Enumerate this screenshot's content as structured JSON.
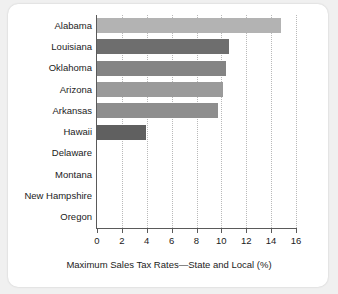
{
  "chart_data": {
    "type": "bar",
    "orientation": "horizontal",
    "title": "",
    "xlabel": "Maximum Sales Tax Rates—State and Local (%)",
    "ylabel": "",
    "xlim": [
      0,
      16
    ],
    "xticks": [
      0,
      2,
      4,
      6,
      8,
      10,
      12,
      14,
      16
    ],
    "grid": "vertical-dotted",
    "legend": "none",
    "categories": [
      "Alabama",
      "Louisiana",
      "Oklahoma",
      "Arizona",
      "Arkansas",
      "Hawaii",
      "Delaware",
      "Montana",
      "New Hampshire",
      "Oregon"
    ],
    "values": [
      14.8,
      10.6,
      10.4,
      10.1,
      9.7,
      3.9,
      0,
      0,
      0,
      0
    ],
    "bar_colors": [
      "#b3b3b3",
      "#6e6e6e",
      "#848484",
      "#9a9a9a",
      "#8e8e8e",
      "#606060",
      "#8a8a8a",
      "#8a8a8a",
      "#8a8a8a",
      "#8a8a8a"
    ]
  },
  "axis": {
    "line_color": "#5a5a5a",
    "grid_color": "#b9b9b9"
  },
  "card": {
    "background": "#ffffff",
    "page_background": "#f0f0f0"
  }
}
